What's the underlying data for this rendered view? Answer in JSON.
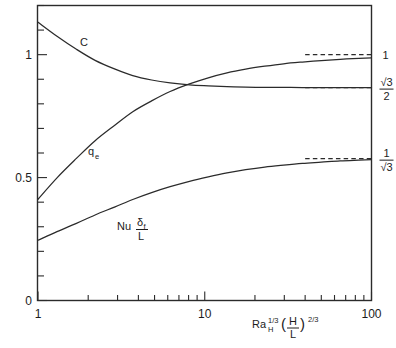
{
  "figure": {
    "background_color": "#ffffff",
    "ink_color": "#2b2b2b",
    "width": 396,
    "height": 348
  },
  "axes": {
    "x": {
      "label_parts": {
        "base": "Ra",
        "base_sub": "H",
        "base_sup": "1/3",
        "paren_open": "(",
        "frac_num": "H",
        "frac_den": "L",
        "paren_close": ")",
        "paren_sup": "2/3"
      },
      "scale": "log",
      "min": 1,
      "max": 100,
      "tick_labels": [
        "1",
        "10",
        "100"
      ],
      "tick_values": [
        1,
        10,
        100
      ],
      "minor_ticks": [
        2,
        3,
        4,
        5,
        6,
        7,
        8,
        9,
        20,
        30,
        40,
        50,
        60,
        70,
        80,
        90
      ]
    },
    "y": {
      "scale": "linear",
      "min": 0,
      "max": 1.2,
      "tick_labels": [
        "0",
        "0.5",
        "1"
      ],
      "tick_values": [
        0,
        0.5,
        1
      ],
      "minor_ticks": [
        0.1,
        0.2,
        0.3,
        0.4,
        0.6,
        0.7,
        0.8,
        0.9,
        1.1,
        1.2
      ]
    }
  },
  "right_labels": [
    {
      "name": "asymptote-one",
      "value": 1.0,
      "kind": "plain",
      "text": "1"
    },
    {
      "name": "asymptote-sqrt3-over-2",
      "value": 0.866,
      "kind": "fraction",
      "numerator": "√3",
      "denominator": "2"
    },
    {
      "name": "asymptote-one-over-sqrt3",
      "value": 0.577,
      "kind": "fraction",
      "numerator": "1",
      "denominator": "√3"
    }
  ],
  "curve_labels": [
    {
      "name": "label-C",
      "text": "C",
      "x_px": 80,
      "y_px": 46
    },
    {
      "name": "label-qe",
      "base": "q",
      "sub": "e",
      "x_px": 88,
      "y_px": 155
    },
    {
      "name": "label-nu-delta-l",
      "base": "Nu",
      "frac_num": "δ",
      "frac_num_sub": "f",
      "frac_den": "L",
      "x_px": 117,
      "y_px": 227
    }
  ],
  "chart_data": {
    "type": "line",
    "title": "",
    "xlabel": "Ra_H^(1/3) (H/L)^(2/3)",
    "ylabel": "",
    "xscale": "log",
    "xlim": [
      1,
      100
    ],
    "ylim": [
      0,
      1.2
    ],
    "grid": false,
    "legend": "inline-curve-labels",
    "xticks": [
      1,
      10,
      100
    ],
    "xtick_labels": [
      "1",
      "10",
      "100"
    ],
    "yticks": [
      0,
      0.5,
      1
    ],
    "ytick_labels": [
      "0",
      "0.5",
      "1"
    ],
    "x": [
      1,
      1.3,
      1.7,
      2.2,
      2.9,
      3.7,
      4.8,
      6.2,
      8.1,
      10.5,
      13.6,
      17.6,
      22.9,
      29.7,
      38.5,
      50,
      64.9,
      84.1,
      100
    ],
    "series": [
      {
        "name": "C",
        "label": "C",
        "asymptote": 0.866,
        "asymptote_label": "√3/2",
        "values": [
          1.132,
          1.075,
          1.022,
          0.977,
          0.941,
          0.915,
          0.897,
          0.885,
          0.877,
          0.873,
          0.87,
          0.868,
          0.867,
          0.867,
          0.866,
          0.866,
          0.866,
          0.866,
          0.866
        ]
      },
      {
        "name": "q_e",
        "label": "q_e",
        "asymptote": 1.0,
        "asymptote_label": "1",
        "values": [
          0.412,
          0.499,
          0.578,
          0.65,
          0.714,
          0.768,
          0.812,
          0.85,
          0.881,
          0.906,
          0.926,
          0.941,
          0.953,
          0.963,
          0.97,
          0.976,
          0.981,
          0.985,
          0.987
        ]
      },
      {
        "name": "Nu_delta_f_over_L",
        "label": "Nu δf/L",
        "asymptote": 0.577,
        "asymptote_label": "1/√3",
        "values": [
          0.245,
          0.28,
          0.314,
          0.348,
          0.381,
          0.411,
          0.439,
          0.463,
          0.485,
          0.503,
          0.519,
          0.532,
          0.543,
          0.551,
          0.558,
          0.563,
          0.568,
          0.571,
          0.573
        ]
      }
    ],
    "annotations": [
      {
        "text": "C and q_e curves cross near x = 9, y = 0.87"
      }
    ]
  }
}
